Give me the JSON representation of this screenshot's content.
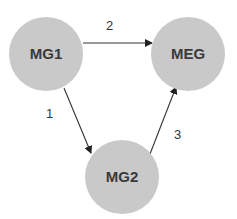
{
  "diagram": {
    "nodes": [
      {
        "id": "MG1",
        "label": "MG1"
      },
      {
        "id": "MEG",
        "label": "MEG"
      },
      {
        "id": "MG2",
        "label": "MG2"
      }
    ],
    "edges": [
      {
        "from": "MG1",
        "to": "MG2",
        "label": "1"
      },
      {
        "from": "MG1",
        "to": "MEG",
        "label": "2"
      },
      {
        "from": "MG2",
        "to": "MEG",
        "label": "3"
      }
    ],
    "colors": {
      "node_fill": "#c9c9c9",
      "text": "#3a3a3a",
      "edge": "#333333"
    }
  }
}
